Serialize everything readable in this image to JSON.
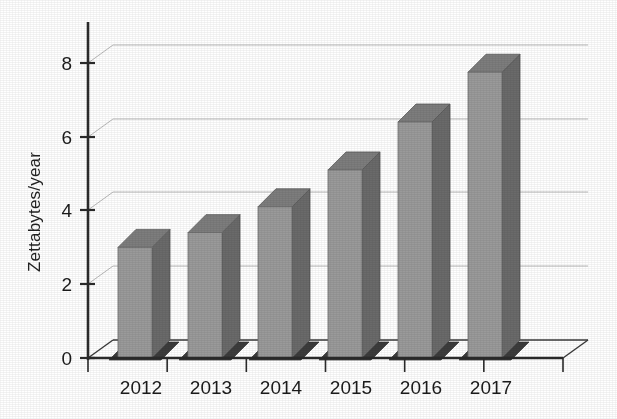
{
  "chart_data": {
    "type": "bar",
    "title": "",
    "subtitle": "",
    "xlabel": "",
    "ylabel": "Zettabytes/year",
    "categories": [
      "2012",
      "2013",
      "2014",
      "2015",
      "2016",
      "2017"
    ],
    "values": [
      3.0,
      3.4,
      4.1,
      5.1,
      6.4,
      7.75
    ],
    "series": [
      {
        "name": "Zettabytes/year",
        "values": [
          3.0,
          3.4,
          4.1,
          5.1,
          6.4,
          7.75
        ]
      }
    ],
    "ylim": [
      0,
      8.6
    ],
    "ytick_labels": [
      "0",
      "2",
      "4",
      "6",
      "8"
    ],
    "ytick_values": [
      0,
      2,
      4,
      6,
      8
    ],
    "grid": true,
    "grid_axis": "y",
    "legend": false,
    "legend_position": "none",
    "projection": "3d",
    "annotations": [],
    "colors": {
      "bar_front": "#9a9a9a",
      "bar_side": "#6a6a6a",
      "bar_top": "#7d7d7d",
      "plinth": "#3c3c3c",
      "gridline": "#b9b9b9",
      "axis": "#2b2b2b",
      "text": "#1b1b1b",
      "background": "#ffffff"
    }
  }
}
